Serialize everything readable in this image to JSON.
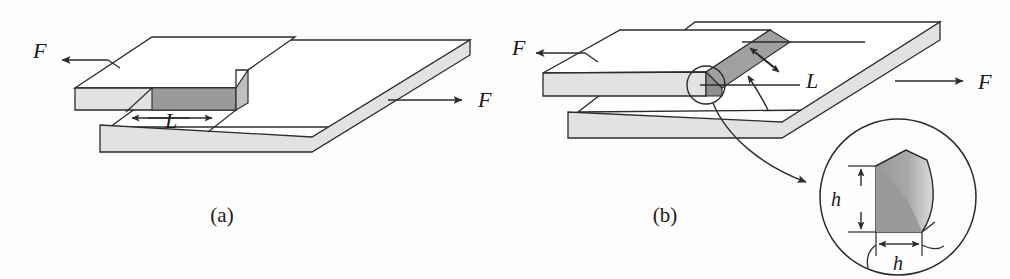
{
  "figure": {
    "background_color": "#fdfdfd",
    "line_color": "#2b2b2b",
    "colors": {
      "plate_edge_light": "#e2e2e2",
      "plate_face": "#ffffff",
      "weld_dark": "#9a9a9a",
      "weld_mid": "#b5b5b5",
      "weld_light": "#dcdcdc",
      "stroke": "#2b2b2b"
    }
  },
  "panels": [
    {
      "id": "a",
      "caption": "(a)",
      "caption_x": 222,
      "caption_y": 218,
      "labels": [
        {
          "name": "force-left",
          "text": "F",
          "x": 33,
          "y": 58
        },
        {
          "name": "force-right",
          "text": "F",
          "x": 478,
          "y": 100
        },
        {
          "name": "length",
          "text": "L",
          "x": 165,
          "y": 127
        }
      ]
    },
    {
      "id": "b",
      "caption": "(b)",
      "caption_x": 665,
      "caption_y": 218,
      "labels": [
        {
          "name": "force-left",
          "text": "F",
          "x": 512,
          "y": 50
        },
        {
          "name": "force-right",
          "text": "F",
          "x": 985,
          "y": 90
        },
        {
          "name": "length",
          "text": "L",
          "x": 808,
          "y": 80
        },
        {
          "name": "weld-size-vertical",
          "text": "h",
          "x": 845,
          "y": 200
        },
        {
          "name": "weld-size-horizontal",
          "text": "h",
          "x": 890,
          "y": 257
        }
      ]
    }
  ],
  "annotations": {
    "detail_circle": {
      "cx": 706,
      "cy": 85,
      "r": 19
    },
    "inset_circle": {
      "cx": 898,
      "cy": 197,
      "r": 78
    }
  }
}
